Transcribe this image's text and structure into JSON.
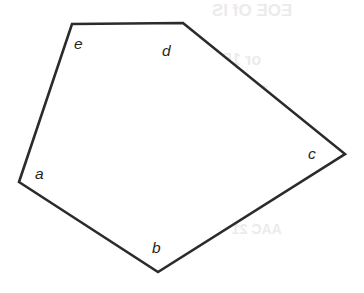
{
  "figure": {
    "type": "polygon-diagram",
    "shape_name": "pentagon",
    "background_color": "#ffffff",
    "stroke_color": "#2b2b2b",
    "stroke_width": 2.6,
    "fill_color": "#ffffff",
    "canvas": {
      "width": 364,
      "height": 293
    },
    "points_attr": "19,182 158,272 345,154 183,23 72,24",
    "vertices": [
      {
        "id": "a",
        "label": "a",
        "x": 19,
        "y": 182,
        "label_x": 35,
        "label_y": 166
      },
      {
        "id": "b",
        "label": "b",
        "x": 158,
        "y": 272,
        "label_x": 152,
        "label_y": 240
      },
      {
        "id": "c",
        "label": "c",
        "x": 345,
        "y": 154,
        "label_x": 308,
        "label_y": 146
      },
      {
        "id": "d",
        "label": "d",
        "x": 183,
        "y": 23,
        "label_x": 162,
        "label_y": 43
      },
      {
        "id": "e",
        "label": "e",
        "x": 72,
        "y": 24,
        "label_x": 74,
        "label_y": 36
      }
    ]
  },
  "artifacts": {
    "description": "faint mirrored bleed-through text from the reverse of the scanned page",
    "color": "#ebebeb",
    "marks": [
      {
        "text": "EOE Of IS",
        "x": 212,
        "y": 2,
        "size": 17
      },
      {
        "text": "or 150",
        "x": 214,
        "y": 52,
        "size": 16
      },
      {
        "text": "100 cc",
        "x": 222,
        "y": 82,
        "size": 15
      },
      {
        "text": "60",
        "x": 246,
        "y": 196,
        "size": 15
      },
      {
        "text": "AAC 21",
        "x": 232,
        "y": 222,
        "size": 14
      }
    ]
  }
}
